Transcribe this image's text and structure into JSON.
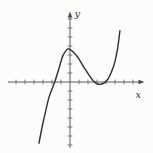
{
  "colors": {
    "background": "#fcfcfa",
    "axis": "#4b4b4b",
    "tick": "#5a5a5a",
    "curve": "#2d2d2d",
    "label": "#3a3a3a"
  },
  "chart_data": {
    "type": "line",
    "title": "",
    "xlabel": "x",
    "ylabel": "y",
    "grid": false,
    "legend": false,
    "x_tick_step": 1,
    "y_tick_step": 1,
    "x_ticks": [
      -6,
      -5,
      -4,
      -3,
      -2,
      -1,
      1,
      2,
      3,
      4,
      5,
      6,
      7
    ],
    "y_ticks": [
      -7,
      -6,
      -5,
      -4,
      -3,
      -2,
      -1,
      1,
      2,
      3,
      4,
      5,
      6,
      7
    ],
    "xlim": [
      -7,
      8.2
    ],
    "ylim": [
      -7.4,
      7.8
    ],
    "series": [
      {
        "name": "cubic-curve",
        "x": [
          -3.45,
          -3.1,
          -2.7,
          -2.3,
          -1.7,
          -1.2,
          -0.8,
          -0.35,
          -0.1,
          0.3,
          0.9,
          1.5,
          2.1,
          2.6,
          3.0,
          3.4,
          3.8,
          4.2,
          4.6,
          5.0,
          5.3,
          5.55
        ],
        "y": [
          -6.8,
          -5.0,
          -3.2,
          -1.6,
          0,
          1.6,
          2.9,
          3.6,
          3.65,
          3.4,
          2.7,
          1.7,
          0.8,
          0.1,
          -0.2,
          -0.25,
          -0.1,
          0.3,
          1.1,
          2.3,
          3.8,
          5.7
        ]
      }
    ],
    "features": {
      "x_intercept": -1.7,
      "local_max": [
        -0.1,
        3.65
      ],
      "local_min": [
        3.4,
        -0.25
      ]
    },
    "layout": {
      "origin_px": [
        70,
        82
      ],
      "px_per_unit": 9,
      "x_axis_start_px": 8,
      "x_axis_end_px": 139,
      "x_arrow_tip_px": 144.5,
      "y_axis_start_px": 148,
      "y_axis_end_px": 17,
      "y_arrow_tip_px": 11.5,
      "tick_half_px": 2.4,
      "xlabel_pos_px": [
        135.5,
        98
      ],
      "ylabel_pos_px": [
        74.5,
        17
      ]
    }
  }
}
